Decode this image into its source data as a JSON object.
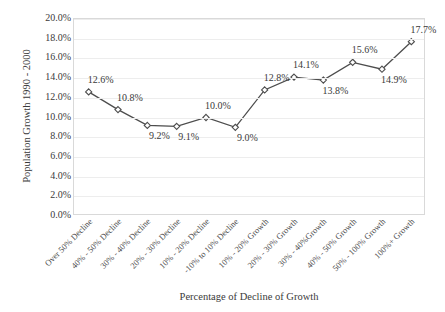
{
  "chart_data": {
    "type": "line",
    "title": "",
    "xlabel": "Percentage of Decline of Growth",
    "ylabel": "Population Growth 1990 - 2000",
    "categories": [
      "Over 50% Decline",
      "40% - 50% Decline",
      "30% - 40% Decline",
      "20% - 30% Decline",
      "10% - 20% Decline",
      "-10% to 10% Decline",
      "10% - 20% Growth",
      "20% - 30% Growth",
      "30% - 40%Growth",
      "40% - 50% Growth",
      "50% - 100% Growth",
      "100%+ Growth"
    ],
    "values": [
      12.6,
      10.8,
      9.2,
      9.1,
      10.0,
      9.0,
      12.8,
      14.1,
      13.8,
      15.6,
      14.9,
      17.7
    ],
    "data_labels": [
      "12.6%",
      "10.8%",
      "9.2%",
      "9.1%",
      "10.0%",
      "9.0%",
      "12.8%",
      "14.1%",
      "13.8%",
      "15.6%",
      "14.9%",
      "17.7%"
    ],
    "label_positions": [
      "above",
      "above",
      "below",
      "below",
      "above",
      "below",
      "above",
      "above",
      "below",
      "above",
      "below",
      "above"
    ],
    "ylim": [
      0.0,
      20.0
    ],
    "ytick_values": [
      0.0,
      2.0,
      4.0,
      6.0,
      8.0,
      10.0,
      12.0,
      14.0,
      16.0,
      18.0,
      20.0
    ],
    "ytick_labels": [
      "0.0%",
      "2.0%",
      "4.0%",
      "6.0%",
      "8.0%",
      "10.0%",
      "12.0%",
      "14.0%",
      "16.0%",
      "18.0%",
      "20.0%"
    ],
    "grid": "horizontal",
    "legend": "none",
    "series_color": "#4d4d4d",
    "marker": "diamond",
    "marker_fill": "#ffffff",
    "gridline_color": "#ededed",
    "border_color": "#d9d9d9",
    "text_color": "#3a3a3a"
  }
}
